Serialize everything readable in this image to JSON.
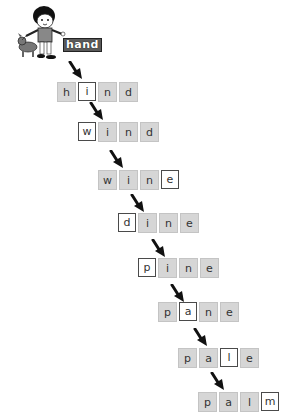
{
  "start": {
    "word": "hand",
    "illustration": "child-with-dog"
  },
  "ladder": [
    {
      "word": "hind",
      "letters": [
        "h",
        "i",
        "n",
        "d"
      ],
      "changed_index": 1,
      "left": 57,
      "top": 82
    },
    {
      "word": "wind",
      "letters": [
        "w",
        "i",
        "n",
        "d"
      ],
      "changed_index": 0,
      "left": 78,
      "top": 122
    },
    {
      "word": "wine",
      "letters": [
        "w",
        "i",
        "n",
        "e"
      ],
      "changed_index": 3,
      "left": 98,
      "top": 170
    },
    {
      "word": "dine",
      "letters": [
        "d",
        "i",
        "n",
        "e"
      ],
      "changed_index": 0,
      "left": 118,
      "top": 213
    },
    {
      "word": "pine",
      "letters": [
        "p",
        "i",
        "n",
        "e"
      ],
      "changed_index": 0,
      "left": 138,
      "top": 258
    },
    {
      "word": "pane",
      "letters": [
        "p",
        "a",
        "n",
        "e"
      ],
      "changed_index": 1,
      "left": 158,
      "top": 302
    },
    {
      "word": "pale",
      "letters": [
        "p",
        "a",
        "l",
        "e"
      ],
      "changed_index": 2,
      "left": 178,
      "top": 348
    },
    {
      "word": "palm",
      "letters": [
        "p",
        "a",
        "l",
        "m"
      ],
      "changed_index": 3,
      "left": 198,
      "top": 392
    }
  ],
  "arrows": [
    {
      "left": 68,
      "top": 61
    },
    {
      "left": 89,
      "top": 102
    },
    {
      "left": 109,
      "top": 150
    },
    {
      "left": 130,
      "top": 194
    },
    {
      "left": 151,
      "top": 239
    },
    {
      "left": 170,
      "top": 284
    },
    {
      "left": 193,
      "top": 328
    },
    {
      "left": 210,
      "top": 372
    }
  ],
  "colors": {
    "cell_bg": "#d6d6d6",
    "highlight_border": "#4a4a4a",
    "arrow": "#111111"
  }
}
